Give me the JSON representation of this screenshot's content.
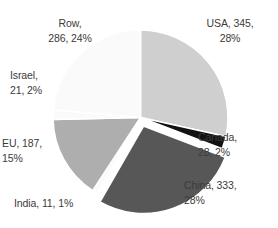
{
  "chart_data": {
    "type": "pie",
    "title": "",
    "subtitle": "",
    "xlabel": "",
    "ylabel": "",
    "legend": "none",
    "grid": false,
    "total": 1211,
    "start_angle_deg": 0,
    "direction": "clockwise",
    "categories": [
      "USA",
      "Canada",
      "China",
      "India",
      "EU",
      "Israel",
      "RoW"
    ],
    "values": [
      345,
      28,
      333,
      11,
      187,
      21,
      286
    ],
    "percents": [
      28,
      2,
      28,
      1,
      15,
      2,
      24
    ],
    "colors": [
      "#cfcfcf",
      "#121212",
      "#575757",
      "#fafafa",
      "#aeaeae",
      "#fafafa",
      "#fafafa"
    ],
    "exploded": [
      "China"
    ],
    "slices": [
      {
        "name": "USA",
        "value": 345,
        "percent": 28,
        "color": "#cfcfcf",
        "label": "USA, 345,\n28%"
      },
      {
        "name": "Canada",
        "value": 28,
        "percent": 2,
        "color": "#121212",
        "label": "Canada,\n28, 2%"
      },
      {
        "name": "China",
        "value": 333,
        "percent": 28,
        "color": "#575757",
        "label": "China, 333,\n28%"
      },
      {
        "name": "India",
        "value": 11,
        "percent": 1,
        "color": "#fafafa",
        "label": "India, 11, 1%"
      },
      {
        "name": "EU",
        "value": 187,
        "percent": 15,
        "color": "#aeaeae",
        "label": "EU, 187,\n15%"
      },
      {
        "name": "Israel",
        "value": 21,
        "percent": 2,
        "color": "#fafafa",
        "label": "Israel,\n21, 2%"
      },
      {
        "name": "RoW",
        "value": 286,
        "percent": 24,
        "color": "#fafafa",
        "label": "Row,\n286, 24%"
      }
    ]
  },
  "labels": {
    "usa": "USA, 345,\n28%",
    "canada": "Canada,\n28, 2%",
    "china": "China, 333,\n28%",
    "india": "India, 11, 1%",
    "eu": "EU, 187,\n15%",
    "israel": "Israel,\n21, 2%",
    "row": "Row,\n286, 24%"
  },
  "style": {
    "text_color": "#3b3b3b",
    "background": "#ffffff",
    "separator_color": "#ffffff"
  }
}
